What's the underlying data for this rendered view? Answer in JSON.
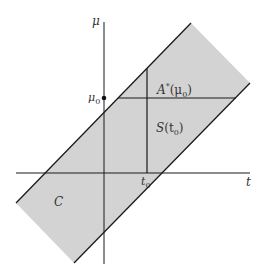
{
  "diagram": {
    "axes": {
      "horizontal_label": "t",
      "vertical_label": "μ"
    },
    "marks": {
      "mu0_label": "μ",
      "mu0_sub": "0",
      "t0_label": "t",
      "t0_sub": "0"
    },
    "regions": {
      "band_label": "C",
      "acceptance_label_main": "A",
      "acceptance_label_sup": "*",
      "acceptance_label_arg": "(μ",
      "acceptance_label_arg_sub": "0",
      "acceptance_label_close": ")",
      "set_label_main": "S",
      "set_label_arg": "(t",
      "set_label_arg_sub": "0",
      "set_label_close": ")"
    },
    "colors": {
      "band_fill": "#d3d3d3",
      "line": "#1a1a1a",
      "text": "#333333"
    }
  }
}
